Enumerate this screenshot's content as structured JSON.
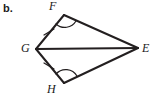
{
  "figure": {
    "part_label": "b.",
    "type": "geometry-diagram",
    "shape": "kite-quadrilateral-with-diagonal",
    "background_color": "#ffffff",
    "stroke_color": "#231f20",
    "vertices": [
      {
        "name": "F",
        "label": "F",
        "x": 64,
        "y": 15,
        "label_x": 49,
        "label_y": 0
      },
      {
        "name": "G",
        "label": "G",
        "x": 36,
        "y": 49,
        "label_x": 21,
        "label_y": 42
      },
      {
        "name": "H",
        "label": "H",
        "x": 64,
        "y": 83,
        "label_x": 47,
        "label_y": 83
      },
      {
        "name": "E",
        "label": "E",
        "x": 138,
        "y": 48,
        "label_x": 142,
        "label_y": 42
      }
    ],
    "segments": [
      {
        "name": "GF",
        "from": "G",
        "to": "F",
        "tick_marks": 1
      },
      {
        "name": "FE",
        "from": "F",
        "to": "E",
        "tick_marks": 0
      },
      {
        "name": "GH",
        "from": "G",
        "to": "H",
        "tick_marks": 1
      },
      {
        "name": "HE",
        "from": "H",
        "to": "E",
        "tick_marks": 0
      },
      {
        "name": "GE",
        "from": "G",
        "to": "E",
        "tick_marks": 0,
        "is_diagonal": true
      }
    ],
    "angle_marks": [
      {
        "name": "angle-F",
        "at_vertex": "F",
        "arcs": 1
      },
      {
        "name": "angle-H",
        "at_vertex": "H",
        "arcs": 1
      }
    ]
  }
}
